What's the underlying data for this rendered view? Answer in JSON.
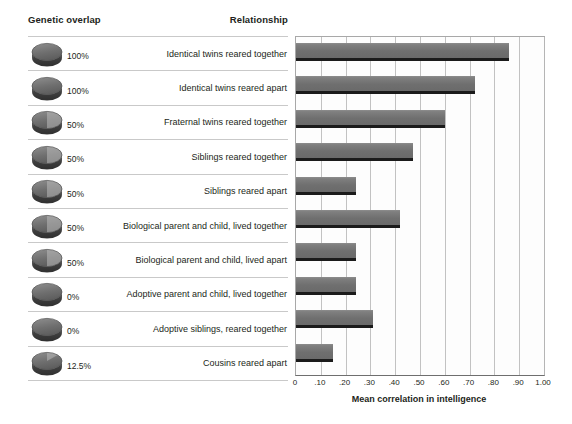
{
  "headers": {
    "genetic_overlap": "Genetic overlap",
    "relationship": "Relationship"
  },
  "axis_title": "Mean correlation in intelligence",
  "colors": {
    "bar_fill": "#747474",
    "bar_shadow": "#1b1b1b",
    "gridline": "#c2c2c2",
    "text": "#231f20",
    "disc_dark": "#6f6f6f",
    "disc_light": "#b9b9b9"
  },
  "rows": [
    {
      "overlap": "100%",
      "overlap_fraction": 1.0,
      "relationship": "Identical twins reared together",
      "value": 0.86
    },
    {
      "overlap": "100%",
      "overlap_fraction": 1.0,
      "relationship": "Identical twins reared apart",
      "value": 0.72
    },
    {
      "overlap": "50%",
      "overlap_fraction": 0.5,
      "relationship": "Fraternal twins reared together",
      "value": 0.6
    },
    {
      "overlap": "50%",
      "overlap_fraction": 0.5,
      "relationship": "Siblings reared together",
      "value": 0.47
    },
    {
      "overlap": "50%",
      "overlap_fraction": 0.5,
      "relationship": "Siblings reared apart",
      "value": 0.24
    },
    {
      "overlap": "50%",
      "overlap_fraction": 0.5,
      "relationship": "Biological parent and child, lived together",
      "value": 0.42
    },
    {
      "overlap": "50%",
      "overlap_fraction": 0.5,
      "relationship": "Biological parent and child, lived apart",
      "value": 0.24
    },
    {
      "overlap": "0%",
      "overlap_fraction": 0.0,
      "relationship": "Adoptive parent and child, lived together",
      "value": 0.24
    },
    {
      "overlap": "0%",
      "overlap_fraction": 0.0,
      "relationship": "Adoptive siblings, reared together",
      "value": 0.31
    },
    {
      "overlap": "12.5%",
      "overlap_fraction": 0.125,
      "relationship": "Cousins reared apart",
      "value": 0.15
    }
  ],
  "chart_data": {
    "type": "bar",
    "orientation": "horizontal",
    "title": "",
    "xlabel": "Mean correlation in intelligence",
    "ylabel": "",
    "xlim": [
      0,
      1.0
    ],
    "grid": true,
    "legend": false,
    "tick_labels": [
      "0",
      ".10",
      ".20",
      ".30",
      ".40",
      ".50",
      ".60",
      ".70",
      ".80",
      ".90",
      "1.00"
    ],
    "tick_values": [
      0,
      0.1,
      0.2,
      0.3,
      0.4,
      0.5,
      0.6,
      0.7,
      0.8,
      0.9,
      1.0
    ],
    "categories": [
      "Identical twins reared together",
      "Identical twins reared apart",
      "Fraternal twins reared together",
      "Siblings reared together",
      "Siblings reared apart",
      "Biological parent and child, lived together",
      "Biological parent and child, lived apart",
      "Adoptive parent and child, lived together",
      "Adoptive siblings, reared together",
      "Cousins reared apart"
    ],
    "values": [
      0.86,
      0.72,
      0.6,
      0.47,
      0.24,
      0.42,
      0.24,
      0.24,
      0.31,
      0.15
    ],
    "genetic_overlap": [
      "100%",
      "100%",
      "50%",
      "50%",
      "50%",
      "50%",
      "50%",
      "0%",
      "0%",
      "12.5%"
    ]
  }
}
